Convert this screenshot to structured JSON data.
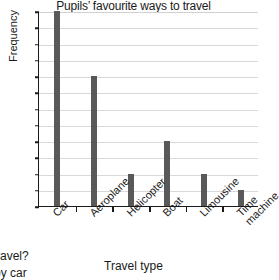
{
  "chart_data": {
    "type": "bar",
    "title": "Pupils’ favourite ways to travel",
    "xlabel": "Travel type",
    "ylabel": "Frequency",
    "categories": [
      "Car",
      "Aeroplane",
      "Helicopter",
      "Boat",
      "Limousine",
      "Time machine"
    ],
    "values": [
      12,
      8,
      2,
      4,
      2,
      1
    ],
    "ylim": [
      0,
      12
    ],
    "ytick_labels": [
      "0",
      "1",
      "2",
      "3",
      "4",
      "5",
      "6",
      "7",
      "8",
      "9",
      "10",
      "11",
      "12"
    ],
    "ytick_step": 1,
    "grid": "horizontal",
    "legend": "none",
    "bar_color": "#595959",
    "gridline_color": "#d9d9d9",
    "axis_color": "#1a1a1a",
    "background": "#ffffff"
  },
  "page_fragments": {
    "question_tail": "ravel?",
    "answer_tail": "by car"
  }
}
